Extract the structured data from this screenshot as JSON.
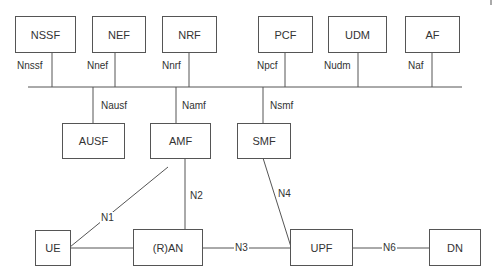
{
  "diagram": {
    "nodes": {
      "nssf": "NSSF",
      "nef": "NEF",
      "nrf": "NRF",
      "pcf": "PCF",
      "udm": "UDM",
      "af": "AF",
      "ausf": "AUSF",
      "amf": "AMF",
      "smf": "SMF",
      "ue": "UE",
      "ran": "(R)AN",
      "upf": "UPF",
      "dn": "DN"
    },
    "interfaces": {
      "nnssf": "Nnssf",
      "nnef": "Nnef",
      "nnrf": "Nnrf",
      "npcf": "Npcf",
      "nudm": "Nudm",
      "naf": "Naf",
      "nausf": "Nausf",
      "namf": "Namf",
      "nsmf": "Nsmf",
      "n1": "N1",
      "n2": "N2",
      "n3": "N3",
      "n4": "N4",
      "n6": "N6"
    },
    "colors": {
      "line": "#555555",
      "text": "#333333",
      "background": "#ffffff"
    }
  }
}
